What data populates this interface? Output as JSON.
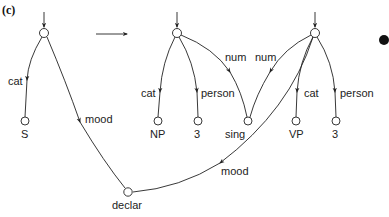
{
  "figure": {
    "caption": "(c)",
    "colors": {
      "stroke": "#222222",
      "background": "#ffffff",
      "dot": "#111111"
    }
  },
  "left_graph": {
    "root": {
      "id": "L0"
    },
    "edges": [
      {
        "label": "cat",
        "to": "S"
      },
      {
        "label": "mood",
        "to": "declar"
      }
    ],
    "leaves": [
      {
        "id": "S",
        "label": "S"
      },
      {
        "id": "declar",
        "label": "declar"
      }
    ]
  },
  "transform_arrow": {
    "direction": "right"
  },
  "right_graph": {
    "np_root": {
      "edges": [
        {
          "label": "cat",
          "to": "NP"
        },
        {
          "label": "person",
          "to": "3"
        },
        {
          "label": "num",
          "to": "sing"
        }
      ],
      "leaves": [
        {
          "id": "NP",
          "label": "NP"
        },
        {
          "id": "np3",
          "label": "3"
        },
        {
          "id": "sing",
          "label": "sing"
        }
      ]
    },
    "vp_root": {
      "edges": [
        {
          "label": "num",
          "to": "sing"
        },
        {
          "label": "cat",
          "to": "VP"
        },
        {
          "label": "person",
          "to": "3"
        },
        {
          "label": "mood",
          "to": "declar"
        }
      ],
      "leaves": [
        {
          "id": "VP",
          "label": "VP"
        },
        {
          "id": "vp3",
          "label": "3"
        }
      ]
    }
  },
  "bullet": {
    "shape": "filled-circle"
  }
}
